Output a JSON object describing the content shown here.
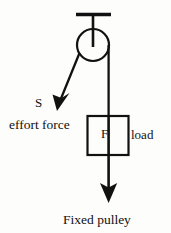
{
  "diagram": {
    "title": "Fixed pulley",
    "caption": "Fixed pulley",
    "background_color": "#fdfdfc",
    "stroke_color": "#111111",
    "labels": {
      "effort_symbol": "S",
      "effort_force": "effort force",
      "block_force": "F",
      "load": "load",
      "caption": "Fixed pulley"
    },
    "components": {
      "ceiling_bracket": {
        "name": "ceiling-support-bar",
        "x1": 76,
        "y1": 14,
        "x2": 111,
        "y2": 14,
        "stroke_width": 3
      },
      "hanger_rod": {
        "name": "pulley-hanger-rod",
        "x1": 93,
        "y1": 14,
        "x2": 93,
        "y2": 47,
        "stroke_width": 2.4
      },
      "pulley_wheel": {
        "name": "pulley-wheel",
        "cx": 93,
        "cy": 45,
        "r": 16,
        "stroke_width": 2.2,
        "fill": "none"
      },
      "effort_rope": {
        "name": "effort-rope",
        "x1": 79,
        "y1": 52,
        "x2": 60,
        "y2": 103,
        "stroke_width": 2.2
      },
      "effort_arrowhead": {
        "name": "effort-force-arrowhead",
        "tip_x": 57,
        "tip_y": 110
      },
      "load_rope": {
        "name": "load-rope",
        "x1": 108,
        "y1": 46,
        "x2": 108,
        "y2": 116,
        "stroke_width": 2.2
      },
      "load_block": {
        "name": "load-block",
        "x": 87,
        "y": 116,
        "width": 41,
        "height": 39,
        "stroke_width": 2.2,
        "fill": "none"
      },
      "weight_rope": {
        "name": "weight-rope",
        "x1": 108,
        "y1": 116,
        "x2": 108,
        "y2": 192,
        "stroke_width": 2.4
      },
      "weight_arrowhead": {
        "name": "weight-force-arrowhead",
        "tip_x": 108,
        "tip_y": 202
      }
    }
  }
}
